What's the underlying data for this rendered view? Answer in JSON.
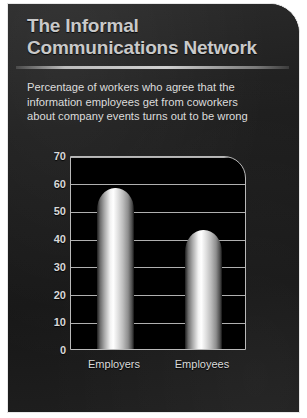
{
  "panel": {
    "title_lines": [
      "The Informal",
      "Communications Network"
    ],
    "subtitle_lines": [
      "Percentage of workers who agree that the",
      "information employees get from coworkers",
      "about company events turns out to be wrong"
    ],
    "background_color": "#1c1c1c",
    "border_color": "#e8e8e8",
    "title_color": "#c9c9c9",
    "subtitle_color": "#dcdcdc"
  },
  "chart_data": {
    "type": "bar",
    "title": "The Informal Communications Network",
    "subtitle": "Percentage of workers who agree that the information employees get from coworkers about company events turns out to be wrong",
    "categories": [
      "Employers",
      "Employees"
    ],
    "values": [
      58,
      43
    ],
    "xlabel": "",
    "ylabel": "",
    "ylim": [
      0,
      70
    ],
    "yticks": [
      0,
      10,
      20,
      30,
      40,
      50,
      60,
      70
    ],
    "ytick_labels": [
      "0",
      "10",
      "20",
      "30",
      "40",
      "50",
      "60",
      "70"
    ],
    "grid": true,
    "legend": false,
    "bar_style": "metallic-gradient-rounded-top",
    "plot_background": "#000000",
    "gridline_color": "#b0b0b0"
  }
}
